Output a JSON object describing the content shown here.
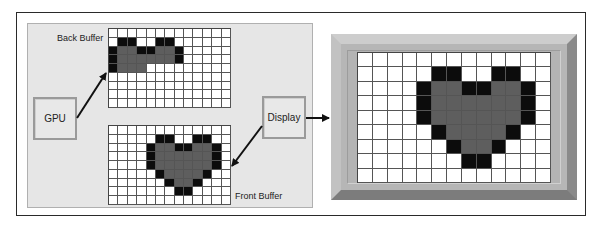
{
  "diagram": {
    "labels": {
      "back_buffer": "Back Buffer",
      "front_buffer": "Front Buffer",
      "gpu": "GPU",
      "display": "Display"
    },
    "colors": {
      "panel_bg": "#e6e6e6",
      "pixel_black": "#0c0c0c",
      "pixel_gray": "#5e5e5e",
      "pixel_white": "#ffffff",
      "frame_gray": "#b6b6b6"
    },
    "grid_size": {
      "cols": 13,
      "rows": 9
    },
    "legend": {
      "k": "black pixel",
      "g": "gray pixel",
      ".": "white pixel"
    },
    "back_buffer_pixels": [
      ".............",
      ".kk..kk......",
      "kggkkggk.....",
      "kggggggk.....",
      "kggg.........",
      ".............",
      ".............",
      ".............",
      "............."
    ],
    "front_buffer_pixels": [
      ".............",
      ".....kk..kk..",
      "....kggkkggk.",
      "....kggggggk.",
      "....kggggggk.",
      ".....kggggk..",
      "......kggk...",
      ".......kk....",
      "............."
    ],
    "display_pixels": [
      ".............",
      ".....kk..kk..",
      "....kggkkggk.",
      "....kggggggk.",
      "....kggggggk.",
      ".....kggggk..",
      "......kggk...",
      ".......kk....",
      "............."
    ],
    "arrows": [
      {
        "from": "gpu",
        "to": "back_buffer"
      },
      {
        "from": "display",
        "to": "front_buffer"
      },
      {
        "from": "display",
        "to": "monitor"
      }
    ]
  }
}
